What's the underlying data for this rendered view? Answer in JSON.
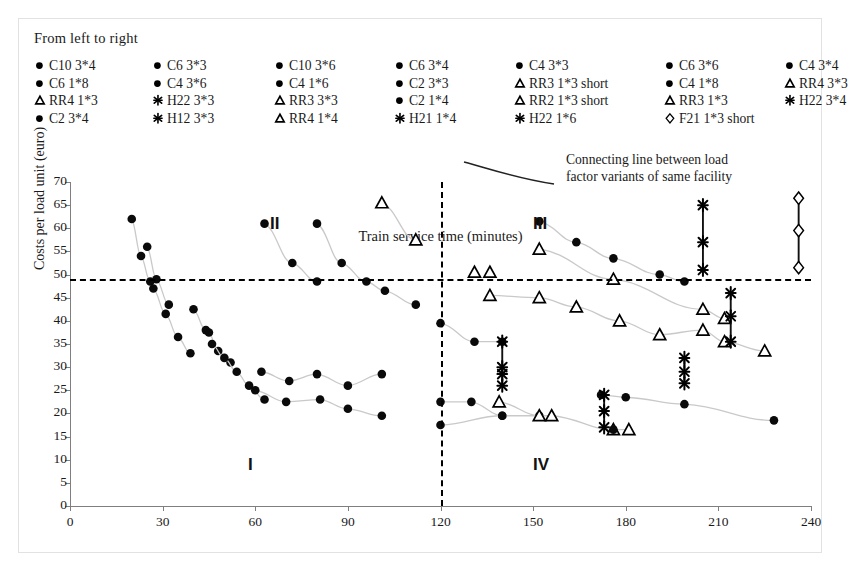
{
  "legend": {
    "title": "From left to right",
    "columns": [
      {
        "x": 10,
        "items": [
          {
            "marker": "circle",
            "label": "C10 3*4"
          },
          {
            "marker": "circle",
            "label": "C6 1*8"
          },
          {
            "marker": "triangle",
            "label": "RR4 1*3"
          },
          {
            "marker": "circle",
            "label": "C2 3*4"
          }
        ]
      },
      {
        "x": 128,
        "items": [
          {
            "marker": "circle",
            "label": "C6 3*3"
          },
          {
            "marker": "circle",
            "label": "C4 3*6"
          },
          {
            "marker": "star",
            "label": "H22 3*3"
          },
          {
            "marker": "star",
            "label": "H12 3*3"
          }
        ]
      },
      {
        "x": 250,
        "items": [
          {
            "marker": "circle",
            "label": "C10 3*6"
          },
          {
            "marker": "circle",
            "label": "C4 1*6"
          },
          {
            "marker": "triangle",
            "label": "RR3 3*3"
          },
          {
            "marker": "triangle",
            "label": "RR4 1*4"
          }
        ]
      },
      {
        "x": 370,
        "items": [
          {
            "marker": "circle",
            "label": "C6 3*4"
          },
          {
            "marker": "circle",
            "label": "C2 3*3"
          },
          {
            "marker": "circle",
            "label": "C2 1*4"
          },
          {
            "marker": "star",
            "label": "H21 1*4"
          }
        ]
      },
      {
        "x": 490,
        "items": [
          {
            "marker": "circle",
            "label": "C4 3*3"
          },
          {
            "marker": "triangle",
            "label": "RR3 1*3 short"
          },
          {
            "marker": "triangle",
            "label": "RR2 1*3 short"
          },
          {
            "marker": "star",
            "label": "H22 1*6"
          }
        ]
      },
      {
        "x": 640,
        "items": [
          {
            "marker": "circle",
            "label": "C6 3*6"
          },
          {
            "marker": "circle",
            "label": "C4 1*8"
          },
          {
            "marker": "triangle",
            "label": "RR3 1*3"
          },
          {
            "marker": "diamond",
            "label": "F21 1*3 short"
          }
        ]
      },
      {
        "x": 760,
        "items": [
          {
            "marker": "circle",
            "label": "C4 3*4"
          },
          {
            "marker": "triangle",
            "label": "RR4 3*3"
          },
          {
            "marker": "star",
            "label": "H22 3*4"
          }
        ]
      }
    ]
  },
  "annotation": {
    "line1": "Connecting line between load",
    "line2": "factor variants of same facility"
  },
  "quadrants": [
    {
      "label": "II",
      "x": 200,
      "y": 32
    },
    {
      "label": "III",
      "x": 463,
      "y": 32
    },
    {
      "label": "I",
      "x": 178,
      "y": 273
    },
    {
      "label": "IV",
      "x": 463,
      "y": 273
    }
  ],
  "chart_data": {
    "type": "scatter",
    "title": "",
    "xlabel": "Train service time (minutes)",
    "ylabel": "Costs per load unit (euro)",
    "xlim": [
      0,
      240
    ],
    "ylim": [
      0,
      70
    ],
    "xticks": [
      0,
      30,
      60,
      90,
      120,
      150,
      180,
      210,
      240
    ],
    "yticks": [
      0,
      5,
      10,
      15,
      20,
      25,
      30,
      35,
      40,
      45,
      50,
      55,
      60,
      65,
      70
    ],
    "grid": false,
    "legend_position": "top",
    "reference_lines": [
      {
        "orientation": "horizontal",
        "value": 49,
        "style": "dashed"
      },
      {
        "orientation": "vertical",
        "value": 120,
        "style": "dashed"
      }
    ],
    "series": [
      {
        "name": "C10 3*4",
        "marker": "circle",
        "connected": true,
        "points": [
          [
            20,
            62
          ],
          [
            23,
            54
          ],
          [
            26,
            48.5
          ]
        ]
      },
      {
        "name": "C6 3*3",
        "marker": "circle",
        "connected": true,
        "points": [
          [
            25,
            56
          ],
          [
            28,
            49
          ],
          [
            32,
            43.5
          ]
        ]
      },
      {
        "name": "C10 3*6",
        "marker": "circle",
        "connected": true,
        "points": [
          [
            27,
            47
          ],
          [
            31,
            41.5
          ],
          [
            35,
            36.5
          ],
          [
            39,
            33
          ]
        ]
      },
      {
        "name": "C6 3*4",
        "marker": "circle",
        "connected": true,
        "points": [
          [
            40,
            42.5
          ],
          [
            44,
            38
          ],
          [
            45,
            37.5
          ],
          [
            48,
            33.5
          ],
          [
            52,
            31
          ]
        ]
      },
      {
        "name": "C4 3*3",
        "marker": "circle",
        "connected": true,
        "points": [
          [
            46,
            35
          ],
          [
            50,
            32
          ],
          [
            54,
            29
          ],
          [
            58,
            26
          ],
          [
            63,
            23
          ]
        ]
      },
      {
        "name": "C6 3*6",
        "marker": "circle",
        "connected": true,
        "points": [
          [
            63,
            61
          ],
          [
            72,
            52.5
          ],
          [
            80,
            48.5
          ]
        ]
      },
      {
        "name": "C4 3*4",
        "marker": "circle",
        "connected": true,
        "points": [
          [
            80,
            61
          ],
          [
            88,
            52.5
          ],
          [
            96,
            48.5
          ],
          [
            102,
            46.5
          ],
          [
            112,
            43.5
          ]
        ]
      },
      {
        "name": "C6 1*8",
        "marker": "circle",
        "connected": true,
        "points": [
          [
            62,
            29
          ],
          [
            71,
            27
          ],
          [
            80,
            28.5
          ],
          [
            90,
            26
          ],
          [
            101,
            28.5
          ]
        ]
      },
      {
        "name": "C4 3*6",
        "marker": "circle",
        "connected": true,
        "points": [
          [
            60,
            25
          ],
          [
            70,
            22.5
          ],
          [
            81,
            23
          ],
          [
            90,
            21
          ],
          [
            101,
            19.5
          ]
        ]
      },
      {
        "name": "RR4 1*3",
        "marker": "triangle",
        "connected": true,
        "points": [
          [
            101,
            65.5
          ],
          [
            112,
            57.5
          ]
        ]
      },
      {
        "name": "C2 3*3",
        "marker": "circle",
        "connected": true,
        "points": [
          [
            120,
            39.5
          ],
          [
            131,
            35.5
          ],
          [
            140,
            35.5
          ]
        ]
      },
      {
        "name": "C2 1*4",
        "marker": "circle",
        "connected": true,
        "points": [
          [
            120,
            22.5
          ],
          [
            130,
            22.5
          ],
          [
            140,
            19.5
          ]
        ]
      },
      {
        "name": "C4 1*6",
        "marker": "circle",
        "connected": true,
        "points": [
          [
            120,
            17.5
          ],
          [
            140,
            19.5
          ],
          [
            152,
            19.5
          ]
        ]
      },
      {
        "name": "RR3 1*3 short",
        "marker": "triangle",
        "connected": false,
        "points": [
          [
            131,
            50.5
          ],
          [
            136,
            50.5
          ]
        ]
      },
      {
        "name": "RR2 1*3 short",
        "marker": "triangle",
        "connected": true,
        "points": [
          [
            136,
            45.5
          ],
          [
            152,
            45
          ],
          [
            164,
            43
          ],
          [
            178,
            40
          ],
          [
            191,
            37
          ],
          [
            205,
            38
          ],
          [
            212,
            35.5
          ],
          [
            225,
            33.5
          ]
        ]
      },
      {
        "name": "RR3 1*3",
        "marker": "triangle",
        "connected": true,
        "points": [
          [
            139,
            22.5
          ],
          [
            152,
            19.5
          ],
          [
            156,
            19.5
          ],
          [
            176,
            16.5
          ],
          [
            181,
            16.5
          ]
        ]
      },
      {
        "name": "H22 3*3",
        "marker": "star",
        "connected": true,
        "vertical_link": true,
        "points": [
          [
            140,
            35.5
          ],
          [
            140,
            30
          ],
          [
            140,
            28.5
          ],
          [
            140,
            26
          ]
        ]
      },
      {
        "name": "C4 1*8",
        "marker": "circle",
        "connected": true,
        "points": [
          [
            152,
            61.5
          ],
          [
            164,
            57
          ],
          [
            176,
            53.5
          ],
          [
            191,
            50
          ],
          [
            199,
            48.5
          ]
        ]
      },
      {
        "name": "RR4 3*3",
        "marker": "triangle",
        "connected": true,
        "points": [
          [
            152,
            55.5
          ],
          [
            176,
            49
          ],
          [
            205,
            42.5
          ],
          [
            212,
            40.5
          ]
        ]
      },
      {
        "name": "C2 3*4",
        "marker": "circle",
        "connected": true,
        "points": [
          [
            172,
            24
          ],
          [
            180,
            23.5
          ],
          [
            199,
            22
          ],
          [
            228,
            18.5
          ]
        ]
      },
      {
        "name": "H21 1*4",
        "marker": "star",
        "connected": true,
        "vertical_link": true,
        "points": [
          [
            173,
            24
          ],
          [
            173,
            20.5
          ],
          [
            173,
            17
          ]
        ]
      },
      {
        "name": "H12 3*3",
        "marker": "star",
        "connected": true,
        "vertical_link": true,
        "points": [
          [
            199,
            32
          ],
          [
            199,
            29
          ],
          [
            199,
            26.5
          ]
        ]
      },
      {
        "name": "H22 1*6",
        "marker": "star",
        "connected": true,
        "vertical_link": true,
        "points": [
          [
            205,
            65
          ],
          [
            205,
            57
          ],
          [
            205,
            51
          ]
        ]
      },
      {
        "name": "H22 3*4",
        "marker": "star",
        "connected": true,
        "vertical_link": true,
        "points": [
          [
            214,
            46
          ],
          [
            214,
            41
          ],
          [
            214,
            35.5
          ]
        ]
      },
      {
        "name": "F21 1*3 short",
        "marker": "diamond",
        "connected": true,
        "vertical_link": true,
        "points": [
          [
            236,
            66.5
          ],
          [
            236,
            59.5
          ],
          [
            236,
            51.5
          ]
        ]
      }
    ],
    "extra_points": [
      {
        "marker": "circle",
        "x": 176,
        "y": 16.5
      }
    ]
  }
}
